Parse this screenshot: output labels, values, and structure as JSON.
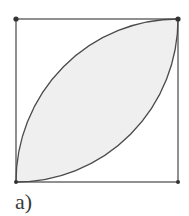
{
  "figure": {
    "caption": "a)",
    "square": {
      "x": 16,
      "y": 19,
      "size": 162,
      "stroke": "#555555"
    },
    "lens": {
      "fill": "#efefef",
      "stroke": "#4a4a4a",
      "description": "Intersection of two quarter-circles of radius equal to the square side, centered at bottom-right and top-left corners"
    },
    "vertices": [
      {
        "name": "top-left",
        "x": 16,
        "y": 19
      },
      {
        "name": "top-right",
        "x": 178,
        "y": 19
      },
      {
        "name": "bottom-left",
        "x": 16,
        "y": 182
      },
      {
        "name": "bottom-right",
        "x": 178,
        "y": 182
      }
    ],
    "vertex_color": "#333333"
  }
}
